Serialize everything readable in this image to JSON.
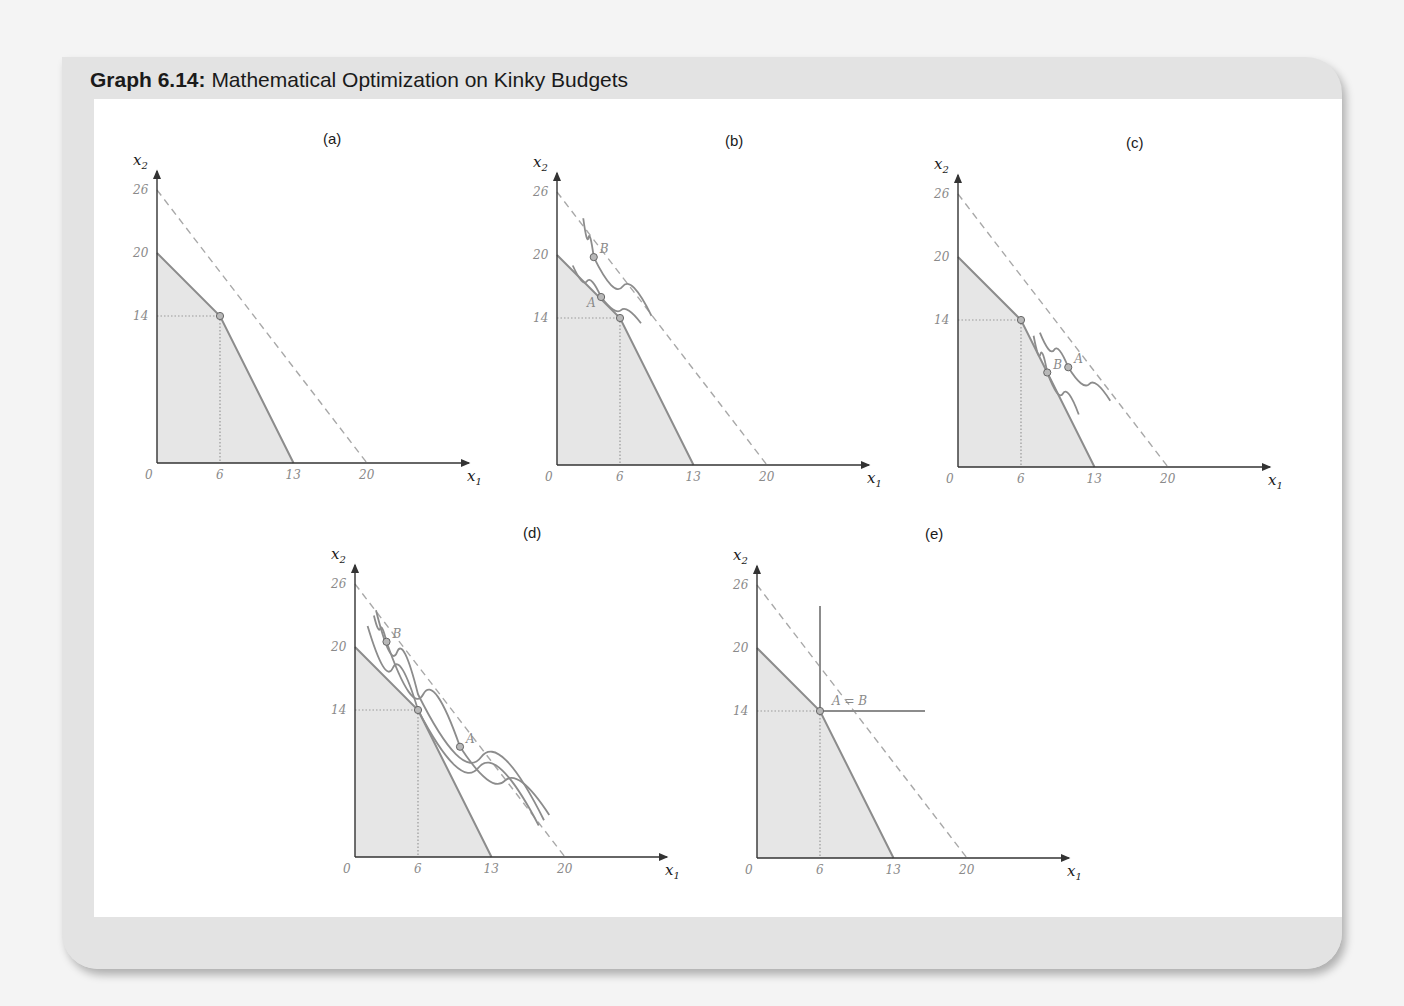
{
  "figure": {
    "title_bold": "Graph 6.14:",
    "title_rest": " Mathematical Optimization on Kinky Budgets"
  },
  "axes": {
    "x_label": "x",
    "x_sub": "1",
    "y_label": "x",
    "y_sub": "2",
    "x_ticks": [
      "0",
      "6",
      "13",
      "20"
    ],
    "y_ticks": [
      "26",
      "20",
      "14"
    ]
  },
  "colors": {
    "budget_fill": "#e6e6e6",
    "budget_line": "#8c8c8c",
    "dashed_line": "#a8a8a8",
    "indifference": "#8c8c8c",
    "point_fill": "#b8b8b8",
    "axis": "#333333"
  },
  "panels": [
    {
      "id": "a",
      "label": "(a)",
      "points": []
    },
    {
      "id": "b",
      "label": "(b)",
      "points": [
        {
          "name": "A",
          "x": 4.2,
          "y": 16
        },
        {
          "name": "B",
          "x": 3.5,
          "y": 19.8
        }
      ]
    },
    {
      "id": "c",
      "label": "(c)",
      "points": [
        {
          "name": "A",
          "x": 10.5,
          "y": 9.5
        },
        {
          "name": "B",
          "x": 8.5,
          "y": 9
        }
      ]
    },
    {
      "id": "d",
      "label": "(d)",
      "points": [
        {
          "name": "A",
          "x": 10,
          "y": 10.5
        },
        {
          "name": "B",
          "x": 3,
          "y": 20.5
        }
      ]
    },
    {
      "id": "e",
      "label": "(e)",
      "points": [
        {
          "name": "A = B",
          "x": 6,
          "y": 14
        }
      ]
    }
  ],
  "chart_data": [
    {
      "type": "line",
      "title": "(a)",
      "xlabel": "x1",
      "ylabel": "x2",
      "xlim": [
        0,
        26
      ],
      "ylim": [
        0,
        28
      ],
      "x_ticks": [
        0,
        6,
        13,
        20
      ],
      "y_ticks": [
        14,
        20,
        26
      ],
      "series": [
        {
          "name": "kinked budget (solid, shaded)",
          "x": [
            0,
            6,
            13
          ],
          "y": [
            20,
            14,
            0
          ]
        },
        {
          "name": "dashed line 1",
          "x": [
            0,
            6
          ],
          "y": [
            26,
            14
          ]
        },
        {
          "name": "dashed line 2",
          "x": [
            6,
            20
          ],
          "y": [
            14,
            0
          ]
        }
      ],
      "annotations": [
        {
          "label": "kink",
          "x": 6,
          "y": 14
        }
      ]
    },
    {
      "type": "line",
      "title": "(b)",
      "xlabel": "x1",
      "ylabel": "x2",
      "xlim": [
        0,
        26
      ],
      "ylim": [
        0,
        28
      ],
      "x_ticks": [
        0,
        6,
        13,
        20
      ],
      "y_ticks": [
        14,
        20,
        26
      ],
      "series": [
        {
          "name": "kinked budget",
          "x": [
            0,
            6,
            13
          ],
          "y": [
            20,
            14,
            0
          ]
        },
        {
          "name": "dashed extensions",
          "x": [
            0,
            6,
            20
          ],
          "y": [
            26,
            14,
            0
          ]
        },
        {
          "name": "indifference curve through A",
          "x": [
            1.5,
            4.2,
            8
          ],
          "y": [
            19,
            16,
            13.5
          ]
        },
        {
          "name": "indifference curve through B",
          "x": [
            2.5,
            3.5,
            9
          ],
          "y": [
            23.5,
            19.8,
            14.2
          ]
        }
      ],
      "annotations": [
        {
          "label": "A",
          "x": 4.2,
          "y": 16
        },
        {
          "label": "B",
          "x": 3.5,
          "y": 19.8
        },
        {
          "label": "kink",
          "x": 6,
          "y": 14
        }
      ]
    },
    {
      "type": "line",
      "title": "(c)",
      "xlabel": "x1",
      "ylabel": "x2",
      "xlim": [
        0,
        26
      ],
      "ylim": [
        0,
        28
      ],
      "x_ticks": [
        0,
        6,
        13,
        20
      ],
      "y_ticks": [
        14,
        20,
        26
      ],
      "series": [
        {
          "name": "kinked budget",
          "x": [
            0,
            6,
            13
          ],
          "y": [
            20,
            14,
            0
          ]
        },
        {
          "name": "dashed extensions",
          "x": [
            0,
            6,
            20
          ],
          "y": [
            26,
            14,
            0
          ]
        },
        {
          "name": "indifference curve through B",
          "x": [
            7.2,
            8.5,
            11.5
          ],
          "y": [
            12.5,
            9,
            5
          ]
        },
        {
          "name": "indifference curve through A",
          "x": [
            7.8,
            10.5,
            14.5
          ],
          "y": [
            12.8,
            9.5,
            6.3
          ]
        }
      ],
      "annotations": [
        {
          "label": "A",
          "x": 10.5,
          "y": 9.5
        },
        {
          "label": "B",
          "x": 8.5,
          "y": 9
        },
        {
          "label": "kink",
          "x": 6,
          "y": 14
        }
      ]
    },
    {
      "type": "line",
      "title": "(d)",
      "xlabel": "x1",
      "ylabel": "x2",
      "xlim": [
        0,
        26
      ],
      "ylim": [
        0,
        28
      ],
      "x_ticks": [
        0,
        6,
        13,
        20
      ],
      "y_ticks": [
        14,
        20,
        26
      ],
      "series": [
        {
          "name": "kinked budget",
          "x": [
            0,
            6,
            13
          ],
          "y": [
            20,
            14,
            0
          ]
        },
        {
          "name": "dashed extensions",
          "x": [
            0,
            6,
            20
          ],
          "y": [
            26,
            14,
            0
          ]
        },
        {
          "name": "indifference curve through kink",
          "x": [
            1.2,
            6,
            17.5
          ],
          "y": [
            22,
            14,
            3
          ]
        },
        {
          "name": "indifference curve through A and B",
          "x": [
            1.8,
            3,
            10,
            18.5
          ],
          "y": [
            23,
            20.5,
            10.5,
            4
          ]
        },
        {
          "name": "indifference curve (outer)",
          "x": [
            2,
            6,
            18
          ],
          "y": [
            23.5,
            15.5,
            3.5
          ]
        }
      ],
      "annotations": [
        {
          "label": "A",
          "x": 10,
          "y": 10.5
        },
        {
          "label": "B",
          "x": 3,
          "y": 20.5
        },
        {
          "label": "kink",
          "x": 6,
          "y": 14
        }
      ]
    },
    {
      "type": "line",
      "title": "(e)",
      "xlabel": "x1",
      "ylabel": "x2",
      "xlim": [
        0,
        26
      ],
      "ylim": [
        0,
        28
      ],
      "x_ticks": [
        0,
        6,
        13,
        20
      ],
      "y_ticks": [
        14,
        20,
        26
      ],
      "series": [
        {
          "name": "kinked budget",
          "x": [
            0,
            6,
            13
          ],
          "y": [
            20,
            14,
            0
          ]
        },
        {
          "name": "dashed extensions",
          "x": [
            0,
            6,
            20
          ],
          "y": [
            26,
            14,
            0
          ]
        },
        {
          "name": "L-shaped indifference curve",
          "x": [
            6,
            6,
            16
          ],
          "y": [
            24,
            14,
            14
          ]
        }
      ],
      "annotations": [
        {
          "label": "A = B",
          "x": 6,
          "y": 14
        }
      ]
    }
  ]
}
